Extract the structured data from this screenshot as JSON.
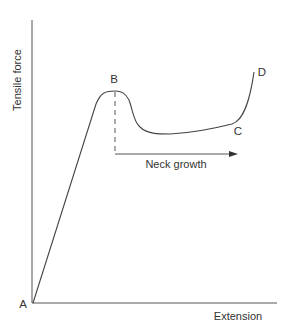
{
  "diagram": {
    "y_axis_label": "Tensile force",
    "x_axis_label": "Extension",
    "points": {
      "A": "A",
      "B": "B",
      "C": "C",
      "D": "D"
    },
    "annotation": "Neck growth",
    "colors": {
      "line": "#444444",
      "text": "#333333",
      "background": "#ffffff"
    }
  }
}
